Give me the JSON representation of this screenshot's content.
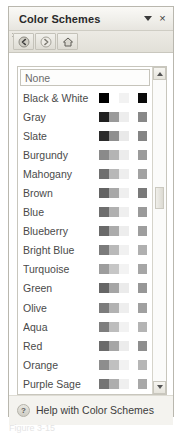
{
  "pane": {
    "title": "Color Schemes",
    "caret_icon": "chevron-down-icon",
    "close_label": "×",
    "section_label": "Apply a color scheme:"
  },
  "toolbar": {
    "buttons": [
      {
        "name": "back-button",
        "icon": "back-arrow-icon"
      },
      {
        "name": "forward-button",
        "icon": "forward-arrow-icon"
      },
      {
        "name": "home-button",
        "icon": "home-icon"
      }
    ]
  },
  "list": {
    "none_label": "None",
    "items": [
      {
        "label": "Black & White",
        "strip": [
          "#000000",
          "#ffffff",
          "#f2f2f2"
        ],
        "swatch": "#0a0a0a"
      },
      {
        "label": "Gray",
        "strip": [
          "#1f1f1f",
          "#9a9a9a",
          "#ededed"
        ],
        "swatch": "#888888"
      },
      {
        "label": "Slate",
        "strip": [
          "#2b2b2b",
          "#8f8f8f",
          "#e9e9e9"
        ],
        "swatch": "#848484"
      },
      {
        "label": "Burgundy",
        "strip": [
          "#8a8a8a",
          "#b4b4b4",
          "#ececec"
        ],
        "swatch": "#9b9b9b"
      },
      {
        "label": "Mahogany",
        "strip": [
          "#6f6f6f",
          "#b8b8b8",
          "#eeeeee"
        ],
        "swatch": "#a2a2a2"
      },
      {
        "label": "Brown",
        "strip": [
          "#636363",
          "#a8a8a8",
          "#efefef"
        ],
        "swatch": "#797979"
      },
      {
        "label": "Blue",
        "strip": [
          "#6e6e6e",
          "#b0b0b0",
          "#efefef"
        ],
        "swatch": "#9a9a9a"
      },
      {
        "label": "Blueberry",
        "strip": [
          "#6a6a6a",
          "#ababab",
          "#ededed"
        ],
        "swatch": "#9e9e9e"
      },
      {
        "label": "Bright Blue",
        "strip": [
          "#7b7b7b",
          "#b9b9b9",
          "#f1f1f1"
        ],
        "swatch": "#b0b0b0"
      },
      {
        "label": "Turquoise",
        "strip": [
          "#9d9d9d",
          "#c6c6c6",
          "#f3f3f3"
        ],
        "swatch": "#a6a6a6"
      },
      {
        "label": "Green",
        "strip": [
          "#666666",
          "#a5a5a5",
          "#ebebeb"
        ],
        "swatch": "#979797"
      },
      {
        "label": "Olive",
        "strip": [
          "#7c7c7c",
          "#b2b2b2",
          "#eeeeee"
        ],
        "swatch": "#a0a0a0"
      },
      {
        "label": "Aqua",
        "strip": [
          "#7e7e7e",
          "#bdbdbd",
          "#f2f2f2"
        ],
        "swatch": "#b4b4b4"
      },
      {
        "label": "Red",
        "strip": [
          "#6b6b6b",
          "#a6a6a6",
          "#ececec"
        ],
        "swatch": "#8e8e8e"
      },
      {
        "label": "Orange",
        "strip": [
          "#8d8d8d",
          "#c0c0c0",
          "#f2f2f2"
        ],
        "swatch": "#b6b6b6"
      },
      {
        "label": "Purple Sage",
        "strip": [
          "#747474",
          "#aeaeae",
          "#efefef"
        ],
        "swatch": "#a8a8a8"
      }
    ]
  },
  "scrollbar": {
    "up_arrow": "scroll-up-icon",
    "down_arrow": "scroll-down-icon",
    "thumb_top_px": 120,
    "thumb_height_px": 22
  },
  "footer": {
    "help_icon": "help-icon",
    "help_label": "Help with Color Schemes"
  },
  "caption": {
    "text": "Figure 3-15"
  }
}
